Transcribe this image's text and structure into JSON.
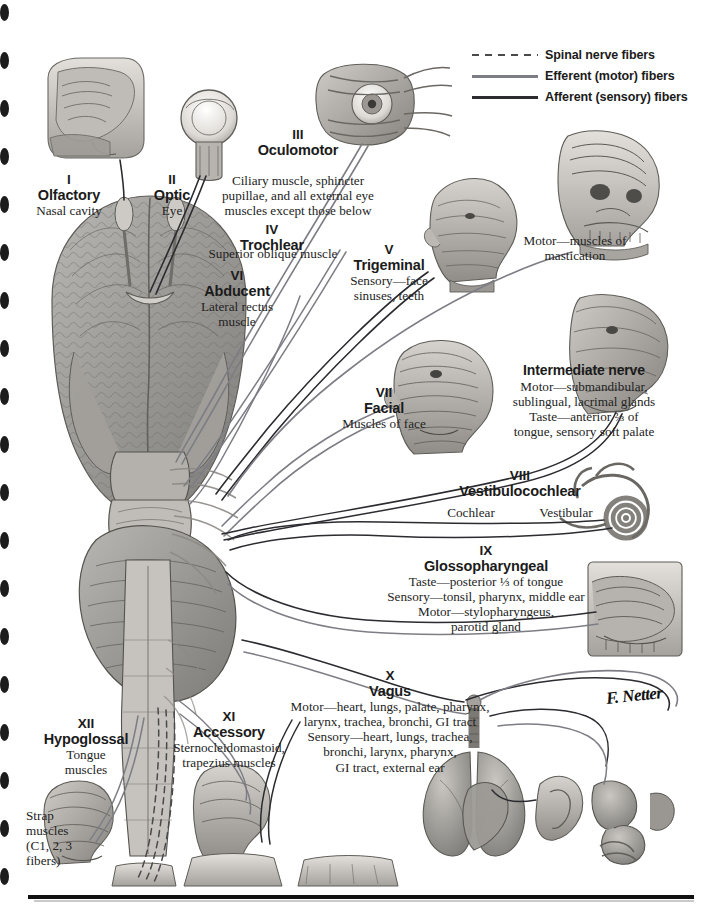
{
  "plate": {
    "title": "Cranial Nerves (Motor and Sensory Distribution): Schema",
    "signature": "F. Netter"
  },
  "legend": {
    "items": [
      {
        "label": "Spinal nerve fibers",
        "style": "dashed",
        "color": "#4a4a4a",
        "icon": "dashed-line-icon"
      },
      {
        "label": "Efferent (motor) fibers",
        "style": "solid",
        "color": "#7d7d85",
        "icon": "solid-line-icon"
      },
      {
        "label": "Afferent (sensory) fibers",
        "style": "solid",
        "color": "#2b2b30",
        "icon": "solid-line-icon"
      }
    ]
  },
  "nerves": [
    {
      "id": "cn1",
      "numeral": "I",
      "name": "Olfactory",
      "desc": "Nasal cavity"
    },
    {
      "id": "cn2",
      "numeral": "II",
      "name": "Optic",
      "desc": "Eye"
    },
    {
      "id": "cn3",
      "numeral": "III",
      "name": "Oculomotor",
      "desc": "Ciliary muscle, sphincter\npupillae, and all external eye\nmuscles except those below"
    },
    {
      "id": "cn4",
      "numeral": "IV",
      "name": "Trochlear",
      "desc": "Superior oblique muscle"
    },
    {
      "id": "cn6",
      "numeral": "VI",
      "name": "Abducent",
      "desc": "Lateral rectus\nmuscle"
    },
    {
      "id": "cn5",
      "numeral": "V",
      "name": "Trigeminal",
      "desc": "Sensory—face\nsinuses, teeth",
      "desc2": "Motor—muscles of\nmastication"
    },
    {
      "id": "cn7",
      "numeral": "VII",
      "name": "Facial",
      "desc": "Muscles of face"
    },
    {
      "id": "intermediate",
      "numeral": "",
      "name": "Intermediate nerve",
      "desc": "Motor—submandibular,\nsublingual, lacrimal glands\nTaste—anterior ⅔ of\ntongue, sensory soft palate"
    },
    {
      "id": "cn8",
      "numeral": "VIII",
      "name": "Vestibulocochlear",
      "branch_a": "Cochlear",
      "branch_b": "Vestibular"
    },
    {
      "id": "cn9",
      "numeral": "IX",
      "name": "Glossopharyngeal",
      "desc": "Taste—posterior ⅓ of tongue\nSensory—tonsil, pharynx, middle ear\nMotor—stylopharyngeus,\nparotid gland"
    },
    {
      "id": "cn10",
      "numeral": "X",
      "name": "Vagus",
      "desc": "Motor—heart, lungs, palate, pharynx,\nlarynx, trachea, bronchi, GI tract\nSensory—heart, lungs, trachea,\nbronchi, larynx, pharynx,\nGI tract, external ear"
    },
    {
      "id": "cn11",
      "numeral": "XI",
      "name": "Accessory",
      "desc": "Sternocleidomastoid,\ntrapezius muscles"
    },
    {
      "id": "cn12",
      "numeral": "XII",
      "name": "Hypoglossal",
      "desc": "Tongue\nmuscles"
    }
  ],
  "annotations": {
    "strap_muscles": "Strap\nmuscles\n(C1, 2, 3\nfibers)"
  },
  "colors": {
    "afferent": "#2b2b30",
    "efferent": "#7d7d85",
    "spinal": "#4a4a4a",
    "text": "#1b1b1b",
    "paper": "#ffffff"
  }
}
